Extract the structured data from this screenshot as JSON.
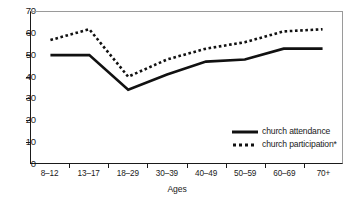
{
  "chart_data": {
    "type": "line",
    "title": "",
    "xlabel": "Ages",
    "ylabel": "",
    "categories": [
      "8–12",
      "13–17",
      "18–29",
      "30–39",
      "40–49",
      "50–59",
      "60–69",
      "70+"
    ],
    "ylim": [
      0,
      70
    ],
    "yticks": [
      "0",
      "10",
      "20",
      "30",
      "40",
      "50",
      "60",
      "70"
    ],
    "ytick_values": [
      0,
      10,
      20,
      30,
      40,
      50,
      60,
      70
    ],
    "grid": false,
    "legend_position": "inside-lower-right",
    "series": [
      {
        "name": "church attendance",
        "style": "solid",
        "color": "#111111",
        "values": [
          50,
          50,
          34,
          41,
          47,
          48,
          53,
          53
        ]
      },
      {
        "name": "church participation*",
        "style": "dotted",
        "color": "#111111",
        "values": [
          57,
          62,
          40,
          48,
          53,
          56,
          61,
          62
        ]
      }
    ]
  },
  "axes": {
    "x_title": "Ages"
  },
  "legend": {
    "items": [
      {
        "label": "church attendance",
        "swatch": "solid-line-swatch"
      },
      {
        "label": "church participation*",
        "swatch": "dotted-line-swatch"
      }
    ]
  },
  "colors": {
    "line": "#111111",
    "axis": "#1a1a1a",
    "frame": "#9a9a9a",
    "background": "#ffffff"
  }
}
